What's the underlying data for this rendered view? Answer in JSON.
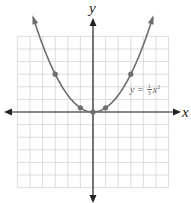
{
  "chart_data": {
    "type": "line",
    "title": "",
    "xlabel": "x",
    "ylabel": "y",
    "xlim": [
      -6,
      6
    ],
    "ylim": [
      -6,
      6
    ],
    "grid": true,
    "series": [
      {
        "name": "y = 1/3 x^2",
        "function": "y = (1/3)x^2",
        "points": [
          {
            "x": -3,
            "y": 3
          },
          {
            "x": -1,
            "y": 0.333
          },
          {
            "x": 0,
            "y": 0
          },
          {
            "x": 1,
            "y": 0.333
          },
          {
            "x": 3,
            "y": 3
          }
        ]
      }
    ],
    "annotations": [
      {
        "text": "y = ⅓x²",
        "x": 4.2,
        "y": 1.6
      }
    ]
  },
  "labels": {
    "x_axis": "x",
    "y_axis": "y",
    "equation_lhs": "y =",
    "equation_num": "1",
    "equation_den": "3",
    "equation_var": "x",
    "equation_exp": "2"
  },
  "colors": {
    "grid": "#d4d4d4",
    "axis": "#222222",
    "curve": "#6e6e6e",
    "points": "#6e6e6e"
  }
}
